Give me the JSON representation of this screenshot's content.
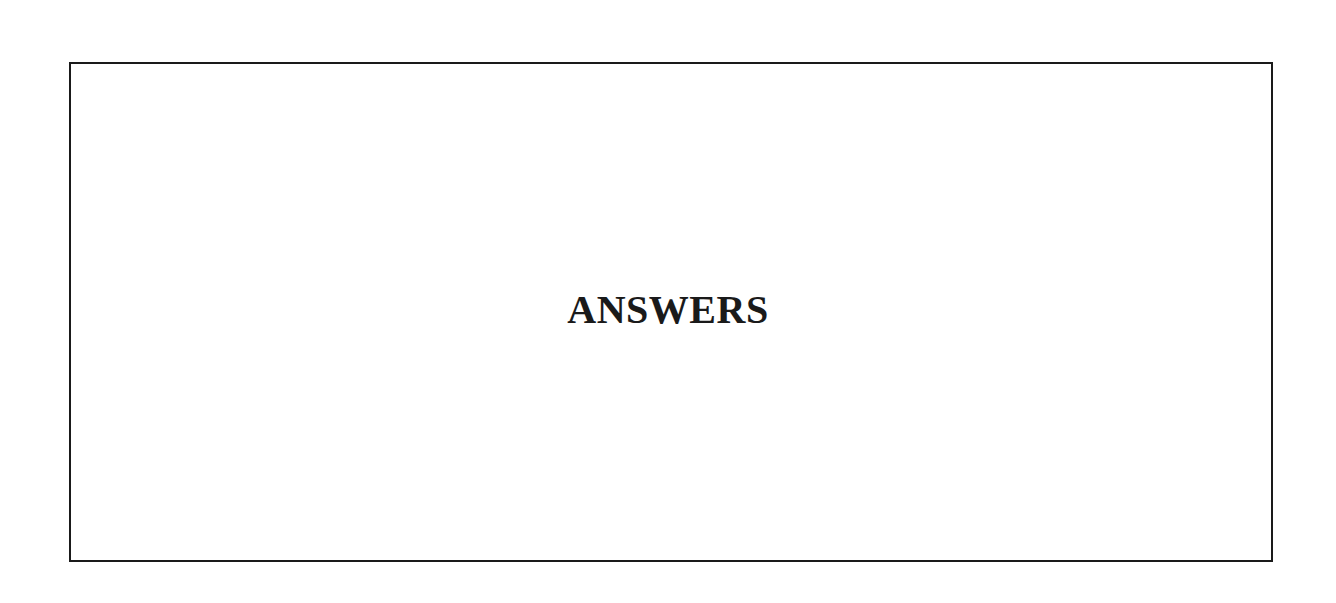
{
  "page": {
    "heading": "ANSWERS"
  }
}
